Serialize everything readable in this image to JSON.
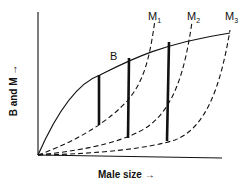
{
  "diagram": {
    "xlabel": "Male size",
    "ylabel": "B and M",
    "curve_labels": {
      "B": "B",
      "M1": "M",
      "M2": "M",
      "M3": "M",
      "sub1": "1",
      "sub2": "2",
      "sub3": "3"
    },
    "arrow": "→"
  }
}
